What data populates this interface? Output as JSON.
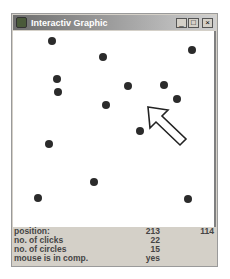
{
  "window": {
    "title": "Interactiv Graphic",
    "controls": {
      "minimize": "_",
      "maximize": "□",
      "close": "×"
    }
  },
  "canvas": {
    "circle_color": "#2b2b2b",
    "circles": [
      {
        "x": 39,
        "y": 10
      },
      {
        "x": 90,
        "y": 26
      },
      {
        "x": 179,
        "y": 19
      },
      {
        "x": 44,
        "y": 48
      },
      {
        "x": 45,
        "y": 61
      },
      {
        "x": 115,
        "y": 55
      },
      {
        "x": 151,
        "y": 54
      },
      {
        "x": 93,
        "y": 74
      },
      {
        "x": 164,
        "y": 68
      },
      {
        "x": 127,
        "y": 100
      },
      {
        "x": 36,
        "y": 113
      },
      {
        "x": 81,
        "y": 151
      },
      {
        "x": 25,
        "y": 167
      },
      {
        "x": 175,
        "y": 168
      }
    ],
    "cursor_icon": "arrow-cursor-icon"
  },
  "info": {
    "rows": [
      {
        "label": "position:",
        "value1": "213",
        "value2": "114"
      },
      {
        "label": "no. of clicks",
        "value1": "22",
        "value2": ""
      },
      {
        "label": "no. of circles",
        "value1": "15",
        "value2": ""
      },
      {
        "label": "mouse is in comp.",
        "value1": "yes",
        "value2": ""
      }
    ]
  }
}
